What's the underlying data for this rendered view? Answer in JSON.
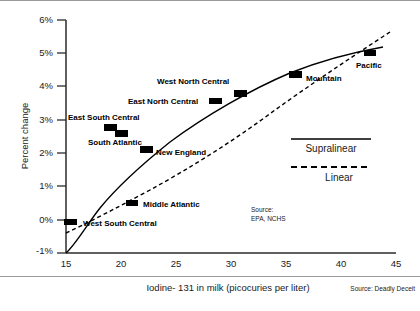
{
  "chart_data": {
    "type": "scatter",
    "title": "",
    "subtitle": "",
    "xlabel": "Iodine- 131 in milk (picocuries per liter)",
    "ylabel": "Percent change",
    "xlim": [
      15,
      45
    ],
    "ylim": [
      -1,
      6
    ],
    "grid": false,
    "x_ticks": [
      "15",
      "20",
      "25",
      "30",
      "35",
      "40",
      "45"
    ],
    "x_tick_values": [
      15,
      20,
      25,
      30,
      35,
      40,
      45
    ],
    "y_ticks": [
      "-1%",
      "0%",
      "1%",
      "2%",
      "3%",
      "4%",
      "5%",
      "6%"
    ],
    "y_tick_values": [
      -1,
      0,
      1,
      2,
      3,
      4,
      5,
      6
    ],
    "points": [
      {
        "name": "East South Central",
        "x": 19.0,
        "y": 2.75,
        "label_dx": -44,
        "label_dy": -9,
        "px": 111,
        "py": 128
      },
      {
        "name": "South Atlantic",
        "x": 20.0,
        "y": 2.6,
        "label_dx": -34,
        "label_dy": 11,
        "px": 122,
        "py": 133
      },
      {
        "name": "New England",
        "x": 22.4,
        "y": 2.1,
        "label_dx": 8,
        "label_dy": 3,
        "px": 147,
        "py": 150
      },
      {
        "name": "East North Central",
        "x": 28.5,
        "y": 3.55,
        "label_dx": -86,
        "label_dy": 3,
        "px": 215,
        "py": 101
      },
      {
        "name": "West North Central",
        "x": 30.8,
        "y": 3.8,
        "label_dx": -84,
        "label_dy": -8,
        "px": 240,
        "py": 94
      },
      {
        "name": "Mountain",
        "x": 35.9,
        "y": 4.35,
        "label_dx": 9,
        "label_dy": 5,
        "px": 296,
        "py": 75
      },
      {
        "name": "Pacific",
        "x": 42.6,
        "y": 5.0,
        "label_dx": -8,
        "label_dy": 13,
        "px": 370,
        "py": 53
      }
    ],
    "offchart_points": [
      {
        "name": "Middle Atlantic",
        "px": 132,
        "py": 203,
        "label_dx": 9,
        "label_dy": 3
      },
      {
        "name": "West South Central",
        "px": 70,
        "py": 222,
        "label_dx": 9,
        "label_dy": 3
      }
    ],
    "series": [
      {
        "name": "Supralinear",
        "style": "solid",
        "path": "M 66,253 C 76,244 88,223 100,208 C 118,186 140,166 170,142 C 205,116 250,90 290,73 C 320,61 355,52 383,47"
      },
      {
        "name": "Linear",
        "style": "dashed",
        "path": "M 66,233 C 90,222 120,206 150,190 C 190,168 235,140 275,110 C 310,85 350,58 390,32"
      }
    ],
    "legend": {
      "position": "inside-right",
      "entries": [
        {
          "label": "Supralinear",
          "style": "solid"
        },
        {
          "label": "Linear",
          "style": "dashed"
        }
      ]
    },
    "annotations": [
      {
        "name": "source-epa",
        "text_line1": "Source:",
        "text_line2": "EPA, NCHS"
      },
      {
        "name": "credit",
        "text": "Source: Deadly Deceit"
      }
    ]
  }
}
